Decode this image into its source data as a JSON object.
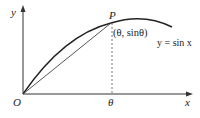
{
  "diagram": {
    "axes": {
      "x_label": "x",
      "y_label": "y",
      "origin_label": "O"
    },
    "curve_label": "y = sin x",
    "point_label": "P",
    "point_coords": "(θ, sinθ)",
    "tick_label": "θ"
  }
}
